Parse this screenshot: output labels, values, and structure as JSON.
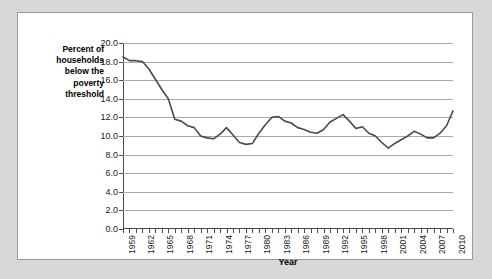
{
  "chart_data": {
    "type": "line",
    "title": "",
    "xlabel": "Year",
    "ylabel": "Percent of households below the poverty threshold",
    "ylim": [
      0.0,
      20.0
    ],
    "xlim": [
      1959,
      2010
    ],
    "grid": true,
    "legend": false,
    "ytick_labels": [
      "20.0",
      "18.0",
      "16.0",
      "14.0",
      "12.0",
      "10.0",
      "8.0",
      "6.0",
      "4.0",
      "2.0",
      "0.0"
    ],
    "ytick_values": [
      20.0,
      18.0,
      16.0,
      14.0,
      12.0,
      10.0,
      8.0,
      6.0,
      4.0,
      2.0,
      0.0
    ],
    "xtick_labels": [
      "1959",
      "1962",
      "1965",
      "1968",
      "1971",
      "1974",
      "1977",
      "1980",
      "1983",
      "1986",
      "1989",
      "1992",
      "1995",
      "1998",
      "2001",
      "2004",
      "2007",
      "2010"
    ],
    "line_color": "#4a4a4a",
    "grid_color": "#a9a9a9",
    "x": [
      1959,
      1960,
      1961,
      1962,
      1963,
      1964,
      1965,
      1966,
      1967,
      1968,
      1969,
      1970,
      1971,
      1972,
      1973,
      1974,
      1975,
      1976,
      1977,
      1978,
      1979,
      1980,
      1981,
      1982,
      1983,
      1984,
      1985,
      1986,
      1987,
      1988,
      1989,
      1990,
      1991,
      1992,
      1993,
      1994,
      1995,
      1996,
      1997,
      1998,
      1999,
      2000,
      2001,
      2002,
      2003,
      2004,
      2005,
      2006,
      2007,
      2008,
      2009,
      2010
    ],
    "values": [
      18.5,
      18.1,
      18.1,
      18.0,
      17.2,
      16.1,
      15.0,
      14.0,
      11.8,
      11.6,
      11.1,
      10.9,
      10.0,
      9.8,
      9.7,
      10.2,
      10.9,
      10.1,
      9.3,
      9.1,
      9.2,
      10.3,
      11.2,
      12.0,
      12.1,
      11.6,
      11.4,
      10.9,
      10.7,
      10.4,
      10.3,
      10.7,
      11.5,
      11.9,
      12.3,
      11.6,
      10.8,
      11.0,
      10.3,
      10.0,
      9.3,
      8.7,
      9.2,
      9.6,
      10.0,
      10.5,
      10.2,
      9.8,
      9.8,
      10.3,
      11.1,
      12.7
    ]
  },
  "ylabel_lines": "Percent of\nhouseholds\nbelow the\npoverty\nthreshold"
}
